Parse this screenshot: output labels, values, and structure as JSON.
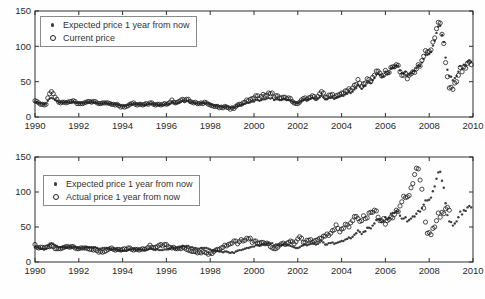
{
  "figure": {
    "width": 485,
    "height": 299,
    "background": "#fefefe"
  },
  "colors": {
    "axis": "#2e2e2e",
    "tick_label": "#2b2b2b",
    "dot_marker": "#3d3d3d",
    "ring_marker": "#1f1f1f",
    "legend_border": "#8a8a8a"
  },
  "chart_data": [
    {
      "type": "scatter",
      "title": "",
      "xlabel": "",
      "ylabel": "",
      "xlim": [
        1990,
        2010
      ],
      "ylim": [
        0,
        150
      ],
      "xticks": [
        1990,
        1992,
        1994,
        1996,
        1998,
        2000,
        2002,
        2004,
        2006,
        2008,
        2010
      ],
      "yticks": [
        0,
        50,
        100,
        150
      ],
      "grid": false,
      "legend_position": "top-left-inside",
      "x_unit": "year-monthly",
      "series": [
        {
          "name": "Expected price 1 year from now",
          "marker": "dot",
          "color": "#3d3d3d",
          "x_start": 1990,
          "x_step_months": 1,
          "values": [
            21,
            21,
            20,
            19,
            19,
            18,
            19,
            23,
            26,
            27,
            26,
            24,
            23,
            21,
            21,
            21,
            21,
            21,
            21,
            21,
            21,
            22,
            21,
            20,
            20,
            20,
            20,
            20,
            21,
            21,
            21,
            21,
            21,
            21,
            20,
            19,
            19,
            20,
            20,
            20,
            19,
            19,
            18,
            18,
            18,
            18,
            17,
            16,
            16,
            16,
            16,
            17,
            18,
            18,
            19,
            18,
            18,
            18,
            18,
            17,
            17,
            18,
            18,
            19,
            19,
            18,
            17,
            18,
            17,
            17,
            17,
            18,
            18,
            18,
            19,
            21,
            20,
            19,
            20,
            21,
            22,
            23,
            22,
            23,
            23,
            21,
            21,
            20,
            20,
            19,
            19,
            20,
            20,
            20,
            20,
            19,
            18,
            17,
            16,
            16,
            16,
            15,
            15,
            14,
            15,
            15,
            14,
            13,
            14,
            13,
            15,
            16,
            17,
            17,
            18,
            19,
            20,
            20,
            21,
            22,
            22,
            24,
            24,
            23,
            24,
            25,
            25,
            26,
            27,
            26,
            27,
            24,
            25,
            25,
            24,
            24,
            25,
            25,
            24,
            24,
            23,
            22,
            21,
            20,
            20,
            21,
            23,
            24,
            25,
            24,
            25,
            26,
            27,
            26,
            25,
            26,
            28,
            30,
            28,
            25,
            25,
            27,
            27,
            28,
            26,
            27,
            28,
            29,
            30,
            30,
            32,
            33,
            35,
            34,
            36,
            39,
            41,
            45,
            43,
            40,
            43,
            44,
            49,
            49,
            48,
            52,
            55,
            60,
            61,
            60,
            57,
            58,
            64,
            61,
            63,
            69,
            70,
            70,
            73,
            72,
            66,
            62,
            62,
            64,
            58,
            60,
            62,
            65,
            65,
            69,
            73,
            72,
            77,
            82,
            88,
            88,
            89,
            92,
            101,
            108,
            119,
            128,
            129,
            116,
            106,
            84,
            67,
            58,
            57,
            52,
            55,
            58,
            64,
            72,
            68,
            74,
            73,
            78,
            80,
            78
          ]
        },
        {
          "name": "Current price",
          "marker": "open-circle",
          "color": "#1f1f1f",
          "x_start": 1990,
          "x_step_months": 1,
          "values": [
            23,
            22,
            20,
            18,
            18,
            17,
            18,
            27,
            33,
            36,
            33,
            28,
            25,
            21,
            20,
            21,
            21,
            20,
            21,
            22,
            22,
            23,
            22,
            19,
            19,
            19,
            19,
            20,
            21,
            22,
            22,
            21,
            22,
            22,
            20,
            19,
            19,
            20,
            20,
            20,
            20,
            19,
            18,
            18,
            17,
            18,
            16,
            14,
            15,
            14,
            15,
            16,
            18,
            19,
            20,
            18,
            17,
            18,
            18,
            17,
            18,
            19,
            18,
            20,
            20,
            18,
            17,
            18,
            18,
            17,
            18,
            19,
            18,
            19,
            21,
            24,
            21,
            20,
            21,
            22,
            24,
            25,
            23,
            25,
            25,
            22,
            21,
            20,
            21,
            19,
            19,
            20,
            19,
            21,
            20,
            18,
            17,
            16,
            15,
            15,
            15,
            13,
            14,
            13,
            15,
            14,
            13,
            11,
            13,
            12,
            15,
            17,
            18,
            18,
            20,
            21,
            24,
            23,
            25,
            26,
            27,
            30,
            30,
            26,
            29,
            32,
            30,
            31,
            34,
            33,
            34,
            28,
            30,
            30,
            27,
            27,
            28,
            28,
            26,
            27,
            26,
            22,
            20,
            19,
            19,
            21,
            24,
            26,
            27,
            25,
            27,
            28,
            30,
            29,
            26,
            29,
            33,
            36,
            34,
            28,
            28,
            31,
            31,
            32,
            28,
            30,
            31,
            32,
            34,
            34,
            37,
            37,
            40,
            38,
            41,
            45,
            46,
            53,
            48,
            43,
            47,
            48,
            54,
            53,
            50,
            56,
            59,
            65,
            65,
            62,
            58,
            59,
            66,
            62,
            63,
            70,
            71,
            71,
            74,
            73,
            64,
            59,
            59,
            62,
            54,
            59,
            61,
            64,
            63,
            68,
            74,
            72,
            80,
            86,
            94,
            92,
            93,
            95,
            106,
            112,
            125,
            134,
            133,
            117,
            104,
            77,
            57,
            41,
            42,
            39,
            48,
            50,
            59,
            70,
            64,
            71,
            69,
            76,
            78,
            74
          ]
        }
      ]
    },
    {
      "type": "scatter",
      "title": "",
      "xlabel": "",
      "ylabel": "",
      "xlim": [
        1990,
        2010
      ],
      "ylim": [
        0,
        150
      ],
      "xticks": [
        1990,
        1992,
        1994,
        1996,
        1998,
        2000,
        2002,
        2004,
        2006,
        2008,
        2010
      ],
      "yticks": [
        0,
        50,
        100,
        150
      ],
      "grid": false,
      "legend_position": "top-left-inside",
      "x_unit": "year-monthly",
      "series": [
        {
          "name": "Expected price 1 year from now",
          "marker": "dot",
          "color": "#3d3d3d",
          "x_start": 1990,
          "x_step_months": 1,
          "values": [
            21,
            21,
            20,
            19,
            19,
            18,
            19,
            23,
            26,
            27,
            26,
            24,
            23,
            21,
            21,
            21,
            21,
            21,
            21,
            21,
            21,
            22,
            21,
            20,
            20,
            20,
            20,
            20,
            21,
            21,
            21,
            21,
            21,
            21,
            20,
            19,
            19,
            20,
            20,
            20,
            19,
            19,
            18,
            18,
            18,
            18,
            17,
            16,
            16,
            16,
            16,
            17,
            18,
            18,
            19,
            18,
            18,
            18,
            18,
            17,
            17,
            18,
            18,
            19,
            19,
            18,
            17,
            18,
            17,
            17,
            17,
            18,
            18,
            18,
            19,
            21,
            20,
            19,
            20,
            21,
            22,
            23,
            22,
            23,
            23,
            21,
            21,
            20,
            20,
            19,
            19,
            20,
            20,
            20,
            20,
            19,
            18,
            17,
            16,
            16,
            16,
            15,
            15,
            14,
            15,
            15,
            14,
            13,
            14,
            13,
            15,
            16,
            17,
            17,
            18,
            19,
            20,
            20,
            21,
            22,
            22,
            24,
            24,
            23,
            24,
            25,
            25,
            26,
            27,
            26,
            27,
            24,
            25,
            25,
            24,
            24,
            25,
            25,
            24,
            24,
            23,
            22,
            21,
            20,
            20,
            21,
            23,
            24,
            25,
            24,
            25,
            26,
            27,
            26,
            25,
            26,
            28,
            30,
            28,
            25,
            25,
            27,
            27,
            28,
            26,
            27,
            28,
            29,
            30,
            30,
            32,
            33,
            35,
            34,
            36,
            39,
            41,
            45,
            43,
            40,
            43,
            44,
            49,
            49,
            48,
            52,
            55,
            60,
            61,
            60,
            57,
            58,
            64,
            61,
            63,
            69,
            70,
            70,
            73,
            72,
            66,
            62,
            62,
            64,
            58,
            60,
            62,
            65,
            65,
            69,
            73,
            72,
            77,
            82,
            88,
            88,
            89,
            92,
            101,
            108,
            119,
            128,
            129,
            116,
            106,
            84,
            67,
            58,
            57,
            52,
            55,
            58,
            64,
            72,
            68,
            74,
            73,
            78,
            80,
            78
          ]
        },
        {
          "name": "Actual price 1 year from now",
          "marker": "open-circle",
          "color": "#1f1f1f",
          "x_start": 1990,
          "x_step_months": 1,
          "values": [
            25,
            21,
            20,
            21,
            21,
            20,
            21,
            22,
            22,
            23,
            22,
            19,
            19,
            19,
            19,
            20,
            21,
            22,
            22,
            21,
            22,
            22,
            20,
            19,
            19,
            20,
            20,
            20,
            20,
            19,
            18,
            18,
            17,
            18,
            16,
            14,
            15,
            14,
            15,
            16,
            18,
            19,
            20,
            18,
            17,
            18,
            18,
            17,
            18,
            19,
            18,
            20,
            20,
            18,
            17,
            18,
            18,
            17,
            18,
            19,
            18,
            19,
            21,
            24,
            21,
            20,
            21,
            22,
            24,
            25,
            23,
            25,
            25,
            22,
            21,
            20,
            21,
            19,
            19,
            20,
            19,
            21,
            20,
            18,
            17,
            16,
            15,
            15,
            15,
            13,
            14,
            13,
            15,
            14,
            13,
            11,
            13,
            12,
            15,
            17,
            18,
            18,
            20,
            21,
            24,
            23,
            25,
            26,
            27,
            30,
            30,
            26,
            29,
            32,
            30,
            31,
            34,
            33,
            34,
            28,
            30,
            30,
            27,
            27,
            28,
            28,
            26,
            27,
            26,
            22,
            20,
            19,
            19,
            21,
            24,
            26,
            27,
            25,
            27,
            28,
            30,
            29,
            26,
            29,
            33,
            36,
            34,
            28,
            28,
            31,
            31,
            32,
            28,
            30,
            31,
            32,
            34,
            34,
            37,
            37,
            40,
            38,
            41,
            45,
            46,
            53,
            48,
            43,
            47,
            48,
            54,
            53,
            50,
            56,
            59,
            65,
            65,
            62,
            58,
            59,
            66,
            62,
            63,
            70,
            71,
            71,
            74,
            73,
            64,
            59,
            59,
            62,
            54,
            59,
            61,
            64,
            63,
            68,
            74,
            72,
            80,
            86,
            94,
            92,
            93,
            95,
            106,
            112,
            125,
            134,
            133,
            117,
            104,
            77,
            57,
            41,
            42,
            39,
            48,
            50,
            59,
            70,
            64,
            71,
            69,
            76,
            78,
            74
          ]
        }
      ]
    }
  ]
}
